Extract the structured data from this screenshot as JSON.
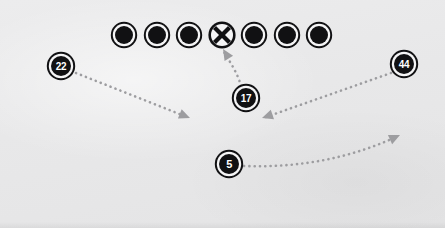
{
  "diagram": {
    "background_color": "#e8e8e9",
    "route_color": "#9d9da0",
    "marker_fill": "#111113",
    "marker_ring": "#f5f5f6",
    "center_fill": "#f5f5f6"
  },
  "offensive_line": {
    "label": "offensive-line",
    "count": 7,
    "y": 35,
    "radius": 11,
    "players": [
      {
        "id": "ol-1",
        "x": 124,
        "y": 35,
        "type": "filled"
      },
      {
        "id": "ol-2",
        "x": 157,
        "y": 35,
        "type": "filled"
      },
      {
        "id": "ol-3",
        "x": 189,
        "y": 35,
        "type": "filled"
      },
      {
        "id": "center",
        "x": 222,
        "y": 35,
        "type": "x-marker"
      },
      {
        "id": "ol-5",
        "x": 254,
        "y": 35,
        "type": "filled"
      },
      {
        "id": "ol-6",
        "x": 287,
        "y": 35,
        "type": "filled"
      },
      {
        "id": "ol-7",
        "x": 319,
        "y": 35,
        "type": "filled"
      }
    ]
  },
  "backs": [
    {
      "id": "player-22",
      "number": "22",
      "x": 61,
      "y": 66,
      "radius": 12
    },
    {
      "id": "player-17",
      "number": "17",
      "x": 246,
      "y": 98,
      "radius": 12
    },
    {
      "id": "player-44",
      "number": "44",
      "x": 404,
      "y": 64,
      "radius": 12
    },
    {
      "id": "player-5",
      "number": "5",
      "x": 229,
      "y": 164,
      "radius": 12
    }
  ],
  "routes": [
    {
      "id": "route-22",
      "label": "route-player-22",
      "from": "22",
      "path": "M 76 73 L 187 117",
      "arrow": {
        "x": 190,
        "y": 118,
        "angle": 22
      }
    },
    {
      "id": "route-17",
      "label": "route-player-17",
      "from": "17",
      "path": "M 241 86 C 238 74, 230 62, 224 52",
      "arrow": {
        "x": 223,
        "y": 49,
        "angle": -122
      }
    },
    {
      "id": "route-44",
      "label": "route-player-44",
      "from": "44",
      "path": "M 391 73 L 266 117",
      "arrow": {
        "x": 262,
        "y": 118,
        "angle": 161
      }
    },
    {
      "id": "route-5",
      "label": "route-player-5",
      "from": "5",
      "path": "M 244 166 C 300 168, 350 158, 396 137",
      "arrow": {
        "x": 400,
        "y": 135,
        "angle": -25
      }
    }
  ]
}
